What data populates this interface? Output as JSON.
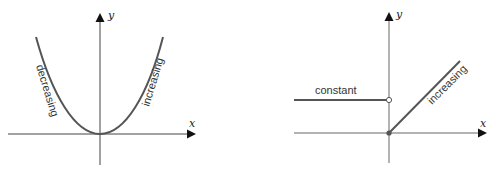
{
  "figures": [
    {
      "name": "parabola",
      "axis_labels": {
        "x": "x",
        "y": "y"
      },
      "labels": {
        "left": "decreasing",
        "right": "increasing"
      }
    },
    {
      "name": "piecewise",
      "axis_labels": {
        "x": "x",
        "y": "y"
      },
      "labels": {
        "constant": "constant",
        "increasing": "increasing"
      }
    }
  ],
  "colors": {
    "curve": "#555555",
    "axis": "#444444"
  }
}
